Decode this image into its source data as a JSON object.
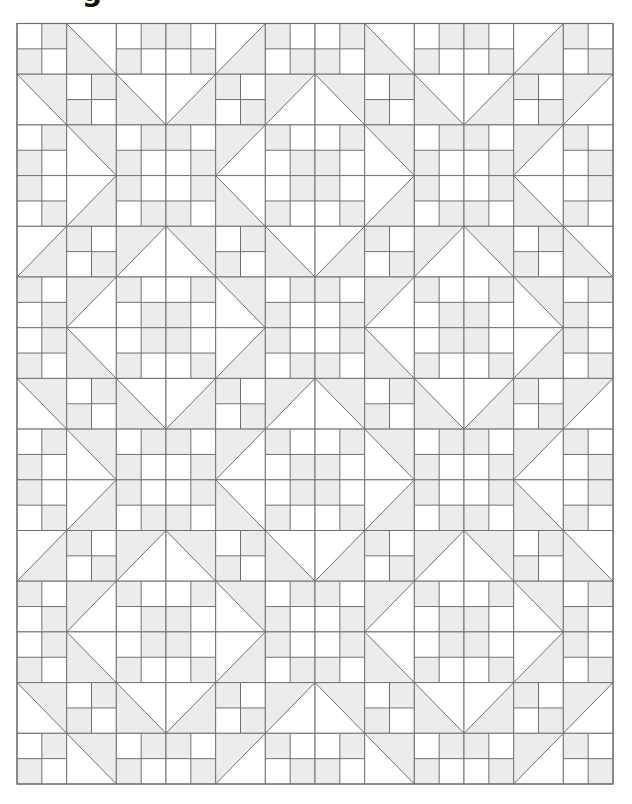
{
  "heading_fragment": "g",
  "colors": {
    "background": "#ffffff",
    "light_fabric": "#ffffff",
    "shaded_fabric": "#ececec",
    "seam_line": "#707070"
  },
  "quilt": {
    "origin": [
      17,
      23.5
    ],
    "size": [
      596,
      760.5
    ],
    "cols": 12,
    "rows": 15,
    "block_legend": {
      "A": "four-patch: top-left light, top-right shaded, bottom-left shaded, bottom-right light",
      "B": "four-patch: top-left shaded, top-right light, bottom-left light, bottom-right shaded",
      "BS-LL": "half-square triangle, diagonal top-left to bottom-right, lower-left shaded",
      "BS-UR": "half-square triangle, diagonal top-left to bottom-right, upper-right shaded",
      "FS-LR": "half-square triangle, diagonal bottom-left to top-right, lower-right shaded",
      "FS-UL": "half-square triangle, diagonal bottom-left to top-right, upper-left shaded"
    },
    "blocks": [
      [
        "A",
        "BS-LL",
        "A",
        "B",
        "FS-LR",
        "B",
        "A",
        "BS-LL",
        "A",
        "B",
        "FS-LR",
        "B"
      ],
      [
        "BS-UR",
        "A",
        "BS-LL",
        "FS-LR",
        "B",
        "FS-UL",
        "BS-UR",
        "A",
        "BS-LL",
        "FS-LR",
        "B",
        "FS-UL"
      ],
      [
        "A",
        "BS-UR",
        "A",
        "B",
        "FS-UL",
        "B",
        "A",
        "BS-UR",
        "A",
        "B",
        "FS-UL",
        "B"
      ],
      [
        "B",
        "FS-LR",
        "B",
        "A",
        "BS-LL",
        "A",
        "B",
        "FS-LR",
        "B",
        "A",
        "BS-LL",
        "A"
      ],
      [
        "FS-LR",
        "B",
        "FS-UL",
        "BS-UR",
        "A",
        "BS-LL",
        "FS-LR",
        "B",
        "FS-UL",
        "BS-UR",
        "A",
        "BS-LL"
      ],
      [
        "B",
        "FS-UL",
        "B",
        "A",
        "BS-UR",
        "A",
        "B",
        "FS-UL",
        "B",
        "A",
        "BS-UR",
        "A"
      ],
      [
        "A",
        "BS-LL",
        "A",
        "B",
        "FS-LR",
        "B",
        "A",
        "BS-LL",
        "A",
        "B",
        "FS-LR",
        "B"
      ],
      [
        "BS-UR",
        "A",
        "BS-LL",
        "FS-LR",
        "B",
        "FS-UL",
        "BS-UR",
        "A",
        "BS-LL",
        "FS-LR",
        "B",
        "FS-UL"
      ],
      [
        "A",
        "BS-UR",
        "A",
        "B",
        "FS-UL",
        "B",
        "A",
        "BS-UR",
        "A",
        "B",
        "FS-UL",
        "B"
      ],
      [
        "B",
        "FS-LR",
        "B",
        "A",
        "BS-LL",
        "A",
        "B",
        "FS-LR",
        "B",
        "A",
        "BS-LL",
        "A"
      ],
      [
        "FS-LR",
        "B",
        "FS-UL",
        "BS-UR",
        "A",
        "BS-LL",
        "FS-LR",
        "B",
        "FS-UL",
        "BS-UR",
        "A",
        "BS-LL"
      ],
      [
        "B",
        "FS-UL",
        "B",
        "A",
        "BS-UR",
        "A",
        "B",
        "FS-UL",
        "B",
        "A",
        "BS-UR",
        "A"
      ],
      [
        "A",
        "BS-LL",
        "A",
        "B",
        "FS-LR",
        "B",
        "A",
        "BS-LL",
        "A",
        "B",
        "FS-LR",
        "B"
      ],
      [
        "BS-UR",
        "A",
        "BS-LL",
        "FS-LR",
        "B",
        "FS-UL",
        "BS-UR",
        "A",
        "BS-LL",
        "FS-LR",
        "B",
        "FS-UL"
      ],
      [
        "A",
        "BS-UR",
        "A",
        "B",
        "FS-UL",
        "B",
        "A",
        "BS-UR",
        "A",
        "B",
        "FS-UL",
        "B"
      ]
    ]
  }
}
